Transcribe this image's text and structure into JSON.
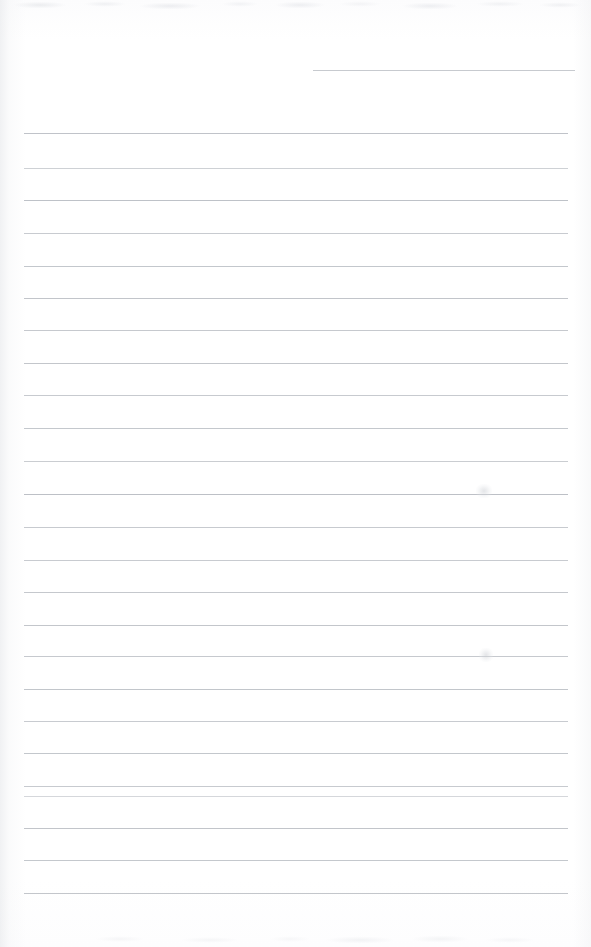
{
  "document": {
    "title": "Scanned blank lined page",
    "kind": "lined-notebook-page",
    "page_width": 591,
    "page_height": 947,
    "paper_color": "#ffffff",
    "rule_color": "#b9bdc3",
    "written_content": "",
    "content_note": "No handwriting or printed text is present on this page."
  },
  "ruled_lines": {
    "count": 26,
    "spacing_px": 32.5,
    "default_left_px": 24,
    "default_right_px": 568,
    "items": [
      {
        "index": 1,
        "y": 70,
        "left": 313,
        "right": 575,
        "opacity": 0.8,
        "partial": true
      },
      {
        "index": 2,
        "y": 133,
        "left": 24,
        "right": 568,
        "opacity": 0.9,
        "partial": false
      },
      {
        "index": 3,
        "y": 168,
        "left": 24,
        "right": 568,
        "opacity": 0.7,
        "partial": false
      },
      {
        "index": 4,
        "y": 200,
        "left": 24,
        "right": 568,
        "opacity": 0.92,
        "partial": false
      },
      {
        "index": 5,
        "y": 233,
        "left": 24,
        "right": 568,
        "opacity": 0.78,
        "partial": false
      },
      {
        "index": 6,
        "y": 266,
        "left": 24,
        "right": 568,
        "opacity": 0.85,
        "partial": false
      },
      {
        "index": 7,
        "y": 298,
        "left": 24,
        "right": 568,
        "opacity": 0.88,
        "partial": false
      },
      {
        "index": 8,
        "y": 330,
        "left": 24,
        "right": 568,
        "opacity": 0.82,
        "partial": false
      },
      {
        "index": 9,
        "y": 363,
        "left": 24,
        "right": 568,
        "opacity": 0.86,
        "partial": false
      },
      {
        "index": 10,
        "y": 395,
        "left": 24,
        "right": 568,
        "opacity": 0.8,
        "partial": false
      },
      {
        "index": 11,
        "y": 428,
        "left": 24,
        "right": 568,
        "opacity": 0.84,
        "partial": false
      },
      {
        "index": 12,
        "y": 461,
        "left": 24,
        "right": 568,
        "opacity": 0.76,
        "partial": false
      },
      {
        "index": 13,
        "y": 494,
        "left": 24,
        "right": 568,
        "opacity": 0.95,
        "partial": false
      },
      {
        "index": 14,
        "y": 527,
        "left": 24,
        "right": 568,
        "opacity": 0.8,
        "partial": false
      },
      {
        "index": 15,
        "y": 560,
        "left": 24,
        "right": 568,
        "opacity": 0.78,
        "partial": false
      },
      {
        "index": 16,
        "y": 592,
        "left": 24,
        "right": 568,
        "opacity": 0.83,
        "partial": false
      },
      {
        "index": 17,
        "y": 625,
        "left": 24,
        "right": 568,
        "opacity": 0.86,
        "partial": false
      },
      {
        "index": 18,
        "y": 656,
        "left": 24,
        "right": 568,
        "opacity": 0.81,
        "partial": false
      },
      {
        "index": 19,
        "y": 689,
        "left": 24,
        "right": 568,
        "opacity": 0.87,
        "partial": false
      },
      {
        "index": 20,
        "y": 721,
        "left": 24,
        "right": 568,
        "opacity": 0.79,
        "partial": false
      },
      {
        "index": 21,
        "y": 753,
        "left": 24,
        "right": 568,
        "opacity": 0.85,
        "partial": false
      },
      {
        "index": 22,
        "y": 786,
        "left": 24,
        "right": 568,
        "opacity": 0.8,
        "partial": false
      },
      {
        "index": 23,
        "y": 796,
        "left": 24,
        "right": 568,
        "opacity": 0.6,
        "partial": false
      },
      {
        "index": 24,
        "y": 828,
        "left": 24,
        "right": 568,
        "opacity": 0.88,
        "partial": false
      },
      {
        "index": 25,
        "y": 860,
        "left": 24,
        "right": 568,
        "opacity": 0.84,
        "partial": false
      },
      {
        "index": 26,
        "y": 893,
        "left": 24,
        "right": 568,
        "opacity": 0.86,
        "partial": false
      }
    ]
  },
  "smudges": [
    {
      "name": "faint-mark-upper-right",
      "x": 476,
      "y": 484,
      "width": 16,
      "height": 14
    },
    {
      "name": "faint-mark-lower-right",
      "x": 479,
      "y": 648,
      "width": 14,
      "height": 14
    }
  ]
}
